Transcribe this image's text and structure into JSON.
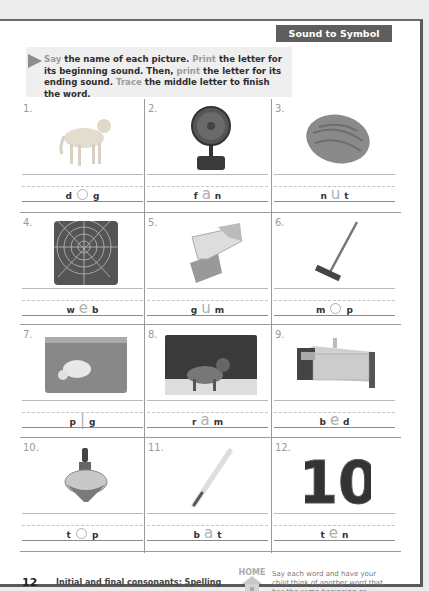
{
  "header": {
    "title": "Sound to Symbol"
  },
  "instructions": {
    "segments": [
      {
        "text": "Say",
        "accent": true
      },
      {
        "text": " the name of each picture. ",
        "accent": false
      },
      {
        "text": "Print",
        "accent": true
      },
      {
        "text": " the letter for its beginning sound. Then, ",
        "accent": false
      },
      {
        "text": "print",
        "accent": true
      },
      {
        "text": " the letter for its ending sound. ",
        "accent": false
      },
      {
        "text": "Trace",
        "accent": true
      },
      {
        "text": " the middle letter to finish the word.",
        "accent": false
      }
    ]
  },
  "items": [
    {
      "number": "1.",
      "picture": "dog",
      "first": "d",
      "middle": "o",
      "last": "g"
    },
    {
      "number": "2.",
      "picture": "fan",
      "first": "f",
      "middle": "a",
      "last": "n"
    },
    {
      "number": "3.",
      "picture": "nut",
      "first": "n",
      "middle": "u",
      "last": "t"
    },
    {
      "number": "4.",
      "picture": "web",
      "first": "w",
      "middle": "e",
      "last": "b"
    },
    {
      "number": "5.",
      "picture": "gum",
      "first": "g",
      "middle": "u",
      "last": "m"
    },
    {
      "number": "6.",
      "picture": "mop",
      "first": "m",
      "middle": "o",
      "last": "p"
    },
    {
      "number": "7.",
      "picture": "pig",
      "first": "p",
      "middle": "i",
      "last": "g"
    },
    {
      "number": "8.",
      "picture": "ram",
      "first": "r",
      "middle": "a",
      "last": "m"
    },
    {
      "number": "9.",
      "picture": "bed",
      "first": "b",
      "middle": "e",
      "last": "d"
    },
    {
      "number": "10.",
      "picture": "top",
      "first": "t",
      "middle": "o",
      "last": "p"
    },
    {
      "number": "11.",
      "picture": "bat",
      "first": "b",
      "middle": "a",
      "last": "t"
    },
    {
      "number": "12.",
      "picture": "ten",
      "first": "t",
      "middle": "e",
      "last": "n"
    }
  ],
  "footer": {
    "page_number": "12",
    "title": "Initial and final consonants: Spelling",
    "home_label": "HOME",
    "home_note": "Say each word and have your child think of another word that has the same beginning or ending sound."
  },
  "colors": {
    "header_bg": "#5e5e5e",
    "instruction_bg": "#efefef",
    "accent_text": "#9b9b9b",
    "trace_letter": "#b0b0b0"
  }
}
